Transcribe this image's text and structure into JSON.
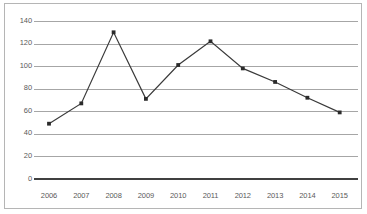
{
  "chart_data": {
    "type": "line",
    "title": "",
    "subtitle": "",
    "xlabel": "",
    "ylabel": "",
    "categories": [
      "2006",
      "2007",
      "2008",
      "2009",
      "2010",
      "2011",
      "2012",
      "2013",
      "2014",
      "2015"
    ],
    "values": [
      49,
      67,
      130,
      71,
      101,
      122,
      98,
      86,
      72,
      59
    ],
    "series": [
      {
        "name": "Series 1",
        "values": [
          49,
          67,
          130,
          71,
          101,
          122,
          98,
          86,
          72,
          59
        ]
      }
    ],
    "ylim": [
      0,
      140
    ],
    "ytick_values": [
      0,
      20,
      40,
      60,
      80,
      100,
      120,
      140
    ],
    "ytick_labels": [
      "0",
      "20",
      "40",
      "60",
      "80",
      "100",
      "120",
      "140"
    ],
    "xtick_labels": [
      "2006",
      "2007",
      "2008",
      "2009",
      "2010",
      "2011",
      "2012",
      "2013",
      "2014",
      "2015"
    ],
    "grid": true,
    "grid_axis": "y",
    "legend": false,
    "legend_position": "none",
    "markers": true,
    "marker_shape": "square",
    "colors": {
      "line": "#3a3a3a",
      "marker": "#2b2b2b",
      "gridline": "#a6a6a6",
      "baseline": "#404040",
      "border": "#b5b5b5",
      "tick_label": "#5a5a5a",
      "background": "#ffffff"
    }
  }
}
